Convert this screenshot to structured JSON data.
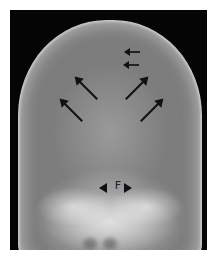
{
  "image": {
    "type": "radiograph",
    "subject": "skull frontal view (X-ray)",
    "frame_color": "#050505",
    "border_color": "#ffffff"
  },
  "annotations": {
    "label_f": "F",
    "arrows": [
      {
        "name": "upper-small-arrow-1",
        "direction": "left"
      },
      {
        "name": "upper-small-arrow-2",
        "direction": "left"
      },
      {
        "name": "left-inner-arrow",
        "direction": "up-left"
      },
      {
        "name": "left-outer-arrow",
        "direction": "up-left"
      },
      {
        "name": "right-inner-arrow",
        "direction": "up-right"
      },
      {
        "name": "right-outer-arrow",
        "direction": "up-right"
      }
    ]
  }
}
